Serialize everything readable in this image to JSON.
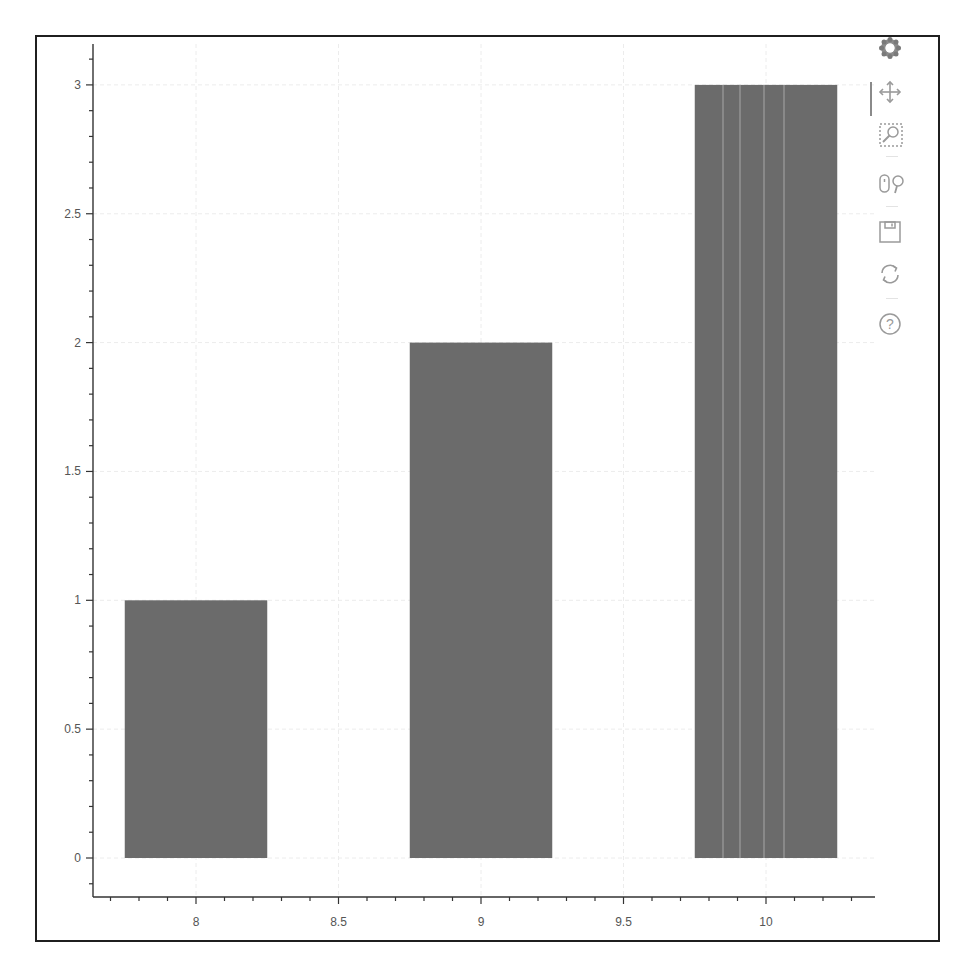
{
  "chart_data": {
    "type": "bar",
    "title": "",
    "xlabel": "",
    "ylabel": "",
    "x": [
      8,
      9,
      10
    ],
    "values": [
      1,
      2,
      3
    ],
    "bar_width": 0.5,
    "bar_color": "#6b6b6b",
    "xlim": [
      7.66,
      10.37
    ],
    "ylim": [
      -0.15,
      3.15
    ],
    "x_ticks": [
      8,
      8.5,
      9,
      9.5,
      10
    ],
    "x_tick_labels": [
      "8",
      "8.5",
      "9",
      "9.5",
      "10"
    ],
    "y_ticks": [
      0,
      0.5,
      1,
      1.5,
      2,
      2.5,
      3
    ],
    "y_tick_labels": [
      "0",
      "0.5",
      "1",
      "1.5",
      "2",
      "2.5",
      "3"
    ],
    "grid": true,
    "legend": null
  },
  "toolbar": {
    "logo": "bokeh-logo-icon",
    "tools": [
      {
        "name": "pan",
        "icon": "pan-move-icon",
        "active": true
      },
      {
        "name": "box_zoom",
        "icon": "box-zoom-icon",
        "active": false
      },
      {
        "name": "wheel_zoom",
        "icon": "wheel-zoom-icon",
        "active": false
      },
      {
        "name": "save",
        "icon": "save-icon",
        "active": false
      },
      {
        "name": "reset",
        "icon": "reset-icon",
        "active": false
      },
      {
        "name": "help",
        "icon": "help-icon",
        "active": false
      }
    ]
  }
}
